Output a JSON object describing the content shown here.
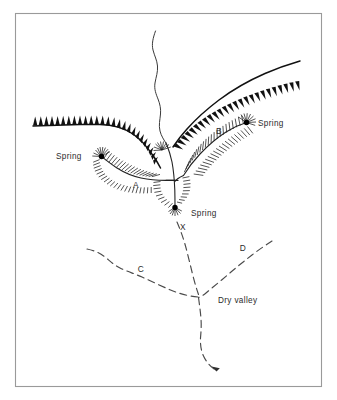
{
  "figure": {
    "background_color": "#ffffff",
    "frame_color": "#9a9a9a",
    "ink_color": "#111111"
  },
  "labels": {
    "spring_left": "Spring",
    "spring_right": "Spring",
    "spring_centre": "Spring",
    "valley_a": "A",
    "valley_b": "B",
    "valley_c": "C",
    "valley_d": "D",
    "point_x": "X",
    "dry_valley": "Dry valley"
  },
  "legend_semantics": {
    "escarpment": "toothed line marking scarp crest",
    "hachure": "comb hachures marking valley sides",
    "dashed_line": "dry valley floor / intermittent channel",
    "solid_thin_line": "perennial stream",
    "dot": "spring head"
  },
  "features": [
    {
      "name": "escarpment-left",
      "type": "escarpment",
      "label": ""
    },
    {
      "name": "escarpment-right",
      "type": "escarpment",
      "label": ""
    },
    {
      "name": "valley-a",
      "type": "spring-fed-valley",
      "label": "A"
    },
    {
      "name": "valley-b",
      "type": "spring-fed-valley",
      "label": "B"
    },
    {
      "name": "valley-c",
      "type": "dry-valley",
      "label": "C"
    },
    {
      "name": "valley-d",
      "type": "dry-valley",
      "label": "D"
    },
    {
      "name": "point-x",
      "type": "locality-marker",
      "label": "X"
    },
    {
      "name": "dry-valley-trunk",
      "type": "dry-valley",
      "label": "Dry valley"
    },
    {
      "name": "headwater-stream",
      "type": "stream",
      "label": ""
    }
  ]
}
